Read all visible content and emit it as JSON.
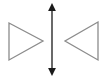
{
  "diagram": {
    "colors": {
      "triangle_stroke": "#8c8c8c",
      "axis_stroke": "#1a1a1a"
    },
    "left_triangle": {
      "points": "9,23 43,41 9,60",
      "pointing": "right"
    },
    "right_triangle": {
      "points": "98,22 65,41 98,60",
      "pointing": "left"
    },
    "axis": {
      "x": 52,
      "y1": 3,
      "y2": 76,
      "type": "double-headed-arrow"
    }
  }
}
